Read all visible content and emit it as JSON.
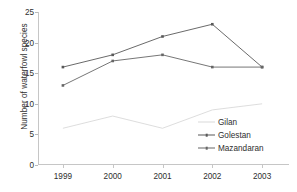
{
  "chart_data": {
    "type": "line",
    "title": "",
    "xlabel": "",
    "ylabel": "Number of waterfowl species",
    "categories": [
      "1999",
      "2000",
      "2001",
      "2002",
      "2003"
    ],
    "x_tick_labels": [
      "1999",
      "2000",
      "2001",
      "2002",
      "2003"
    ],
    "y_tick_labels": [
      "0",
      "5",
      "10",
      "15",
      "20",
      "25"
    ],
    "y_ticks": [
      0,
      5,
      10,
      15,
      20,
      25
    ],
    "ylim": [
      0,
      25
    ],
    "grid": false,
    "legend_position": "inside-right-lower",
    "series": [
      {
        "name": "Gilan",
        "color": "#d9d9d9",
        "marker": "none",
        "values": [
          6,
          8,
          6,
          9,
          10
        ]
      },
      {
        "name": "Golestan",
        "color": "#595959",
        "marker": "square",
        "values": [
          16,
          18,
          21,
          23,
          16
        ]
      },
      {
        "name": "Mazandaran",
        "color": "#666666",
        "marker": "square",
        "values": [
          13,
          17,
          18,
          16,
          16
        ]
      }
    ]
  },
  "legend": {
    "entries": [
      {
        "label": "Gilan"
      },
      {
        "label": "Golestan"
      },
      {
        "label": "Mazandaran"
      }
    ]
  },
  "axes": {
    "y_title": "Number of waterfowl species"
  },
  "colors": {
    "axis": "#c6c6c6",
    "text": "#2e2e2e",
    "gilan": "#d9d9d9",
    "golestan": "#595959",
    "mazandaran": "#666666"
  }
}
